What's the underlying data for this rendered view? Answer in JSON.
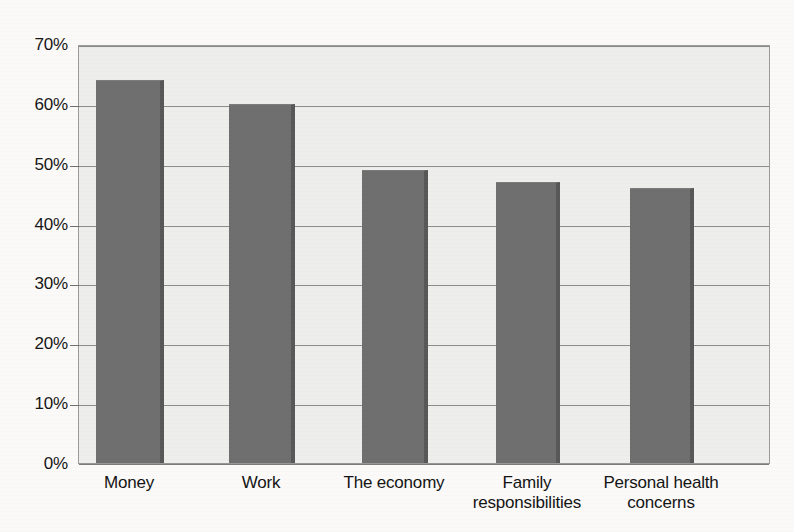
{
  "chart_data": {
    "type": "bar",
    "title": "",
    "subtitle": "",
    "xlabel": "",
    "ylabel": "",
    "categories": [
      "Money",
      "Work",
      "The economy",
      "Family responsibilities",
      "Personal health concerns"
    ],
    "category_lines": [
      [
        "Money"
      ],
      [
        "Work"
      ],
      [
        "The economy"
      ],
      [
        "Family",
        "responsibilities"
      ],
      [
        "Personal health",
        "concerns"
      ]
    ],
    "values": [
      64,
      60,
      49,
      47,
      46
    ],
    "value_labels": [
      "64%",
      "60%",
      "49%",
      "47%",
      "46%"
    ],
    "ylim": [
      0,
      70
    ],
    "ytick_values": [
      0,
      10,
      20,
      30,
      40,
      50,
      60,
      70
    ],
    "ytick_labels": [
      "0%",
      "10%",
      "20%",
      "30%",
      "40%",
      "50%",
      "60%",
      "70%"
    ],
    "grid": true,
    "grid_axis": "y",
    "legend": false,
    "legend_position": "none",
    "series": [
      {
        "name": "Percent reporting",
        "values": [
          64,
          60,
          49,
          47,
          46
        ]
      }
    ],
    "colors": {
      "bar_fill": "#6f6f6f",
      "bar_shadow": "#585858",
      "plot_background": "#eeeeec",
      "gridline": "#8d8d8b",
      "axis_border": "#9a9a98",
      "text": "#161616",
      "page_background": "#fbfaf8"
    }
  }
}
